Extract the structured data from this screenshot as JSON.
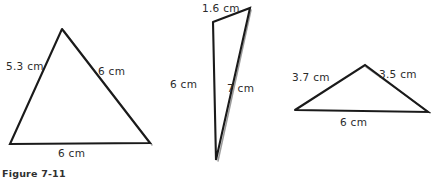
{
  "figure": {
    "caption": "Figure 7-11",
    "background_color": "#ffffff",
    "ink_color": "#1a1a1a",
    "shadow_color": "#8a8a8a",
    "label_color": "#2b2b2b"
  },
  "triangles": [
    {
      "id": "triangle-left",
      "name": "triangle-1",
      "points": "62,29 10,144 150,143 62,29",
      "shadow_points": "64,31 152,145",
      "labels": {
        "left_side": "5.3 cm",
        "right_side": "6 cm",
        "base": "6 cm"
      },
      "label_positions": {
        "left_side": {
          "x": 6,
          "y": 61
        },
        "right_side": {
          "x": 98,
          "y": 66
        },
        "base": {
          "x": 58,
          "y": 148
        }
      }
    },
    {
      "id": "triangle-middle",
      "name": "triangle-2",
      "points": "213,22 250,8 216,160 213,22",
      "shadow_points": "251,10 218,161",
      "labels": {
        "top_side": "1.6 cm",
        "left_side": "6 cm",
        "right_side": "7 cm"
      },
      "label_positions": {
        "top_side": {
          "x": 202,
          "y": 3
        },
        "left_side": {
          "x": 170,
          "y": 79
        },
        "right_side": {
          "x": 227,
          "y": 83
        }
      }
    },
    {
      "id": "triangle-right",
      "name": "triangle-3",
      "points": "295,110 365,65 428,112 295,110",
      "shadow_points": "366,67 430,113",
      "labels": {
        "left_side": "3.7 cm",
        "right_side": "3.5 cm",
        "base": "6 cm"
      },
      "label_positions": {
        "left_side": {
          "x": 292,
          "y": 72
        },
        "right_side": {
          "x": 379,
          "y": 69
        },
        "base": {
          "x": 340,
          "y": 117
        }
      }
    }
  ]
}
